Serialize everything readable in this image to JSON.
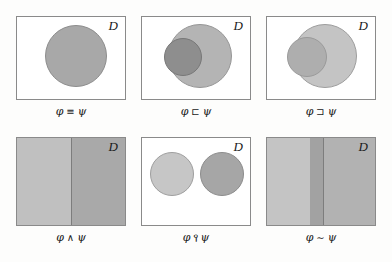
{
  "figure": {
    "domain_label": "D",
    "variables": {
      "phi": "φ",
      "psi": "ψ"
    },
    "panels": [
      {
        "id": "equivalence",
        "domain_letter": "D",
        "caption": "φ ≡ ψ",
        "operator": "≡",
        "left_var": "φ",
        "right_var": "ψ",
        "diagram": "single-circle",
        "shapes": [
          {
            "name": "phi-psi-region",
            "type": "circle",
            "fill": "#a8a8a8",
            "stroke": "#8d8d8d"
          }
        ]
      },
      {
        "id": "strict-subset",
        "domain_letter": "D",
        "caption": "φ ⊏ ψ",
        "operator": "⊏",
        "left_var": "φ",
        "right_var": "ψ",
        "diagram": "small-dark-circle-inside-large-light-circle",
        "shapes": [
          {
            "name": "psi-region",
            "type": "circle",
            "fill": "#b4b4b4",
            "stroke": "#969696"
          },
          {
            "name": "phi-region",
            "type": "circle",
            "fill": "#8e8e8e",
            "stroke": "#777777"
          }
        ]
      },
      {
        "id": "strict-superset",
        "domain_letter": "D",
        "caption": "φ ⊐ ψ",
        "operator": "⊐",
        "left_var": "φ",
        "right_var": "ψ",
        "diagram": "small-light-circle-inside-large-light-circle",
        "shapes": [
          {
            "name": "phi-region",
            "type": "circle",
            "fill": "#c4c4c4",
            "stroke": "#9d9d9d"
          },
          {
            "name": "psi-region",
            "type": "circle",
            "fill": "#aeaeae",
            "stroke": "#9a9a9a"
          }
        ]
      },
      {
        "id": "conjunction-overlap",
        "domain_letter": "D",
        "caption": "φ ∧ ψ",
        "operator": "∧",
        "left_var": "φ",
        "right_var": "ψ",
        "diagram": "two-vertical-halves",
        "shapes": [
          {
            "name": "phi-half",
            "type": "rect",
            "fill": "#c0c0c0"
          },
          {
            "name": "psi-half",
            "type": "rect",
            "fill": "#a9a9a9"
          },
          {
            "name": "half-divider",
            "type": "line",
            "fill": "#7d7d7d"
          }
        ]
      },
      {
        "id": "incompatibility",
        "domain_letter": "D",
        "caption": "φ ⫯ ψ",
        "operator": "⫯",
        "left_var": "φ",
        "right_var": "ψ",
        "diagram": "two-disjoint-circles",
        "shapes": [
          {
            "name": "phi-region",
            "type": "circle",
            "fill": "#c6c6c6",
            "stroke": "#9e9e9e"
          },
          {
            "name": "psi-region",
            "type": "circle",
            "fill": "#a6a6a6",
            "stroke": "#8c8c8c"
          }
        ]
      },
      {
        "id": "similarity",
        "domain_letter": "D",
        "caption": "φ ∼ ψ",
        "operator": "∼",
        "left_var": "φ",
        "right_var": "ψ",
        "diagram": "three-vertical-bands",
        "shapes": [
          {
            "name": "phi-band",
            "type": "rect",
            "fill": "#c4c4c4"
          },
          {
            "name": "overlap-band",
            "type": "rect",
            "fill": "#a2a2a2"
          },
          {
            "name": "psi-band",
            "type": "rect",
            "fill": "#b2b2b2"
          },
          {
            "name": "band-divider",
            "type": "line",
            "fill": "#7d7d7d"
          }
        ]
      }
    ]
  }
}
